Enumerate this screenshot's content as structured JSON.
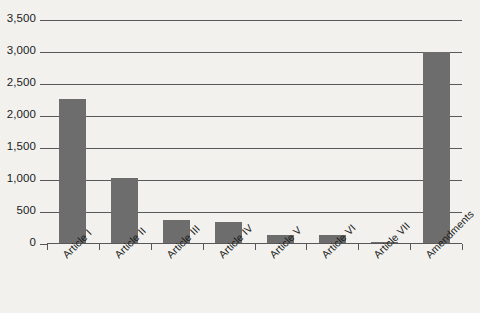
{
  "chart_data": {
    "type": "bar",
    "title": "",
    "subtitle": "",
    "xlabel": "",
    "ylabel": "",
    "categories": [
      "Article I",
      "Article II",
      "Article III",
      "Article IV",
      "Article V",
      "Article VI",
      "Article VII",
      "Amendments"
    ],
    "values": [
      2270,
      1030,
      375,
      345,
      140,
      145,
      25,
      3000
    ],
    "ylim": [
      0,
      3500
    ],
    "ytick_values": [
      0,
      500,
      1000,
      1500,
      2000,
      2500,
      3000,
      3500
    ],
    "ytick_labels": [
      "0",
      "500",
      "1,000",
      "1,500",
      "2,000",
      "2,500",
      "3,000",
      "3,500"
    ],
    "grid": true,
    "legend": false,
    "legend_position": "none",
    "series": [
      {
        "name": "Word count",
        "values": [
          2270,
          1030,
          375,
          345,
          140,
          145,
          25,
          3000
        ],
        "color": "#6d6d6d"
      }
    ]
  },
  "style": {
    "background_color": "#f2f1ee",
    "bar_color": "#6d6d6d",
    "gridline_color": "#58585a",
    "axis_color": "#58585a",
    "text_color": "#1c1c1c"
  }
}
